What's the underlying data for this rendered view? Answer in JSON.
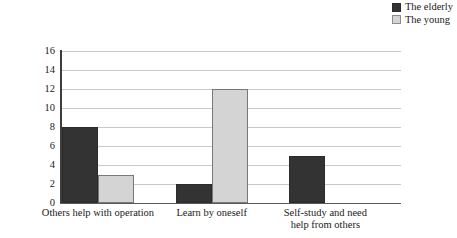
{
  "chart_data": {
    "type": "bar",
    "title": "",
    "xlabel": "",
    "ylabel": "Coded reference points",
    "ylim": [
      0,
      16
    ],
    "yticks": [
      16,
      14,
      12,
      10,
      8,
      6,
      4,
      2,
      0
    ],
    "grid": true,
    "legend_position": "top-right",
    "categories": [
      "Others help with operation",
      "Learn by oneself",
      "Self-study and need help from others"
    ],
    "category_lines": [
      [
        "Others help with operation"
      ],
      [
        "Learn by oneself"
      ],
      [
        "Self-study and need",
        "help from others"
      ]
    ],
    "series": [
      {
        "name": "The elderly",
        "color": "#333333",
        "values": [
          8,
          2,
          5
        ]
      },
      {
        "name": "The young",
        "color": "#d4d4d4",
        "values": [
          3,
          12,
          0
        ]
      }
    ]
  },
  "legend": {
    "items": [
      {
        "label": "The elderly",
        "swatch": "dark-swatch-icon"
      },
      {
        "label": "The young",
        "swatch": "light-swatch-icon"
      }
    ]
  }
}
